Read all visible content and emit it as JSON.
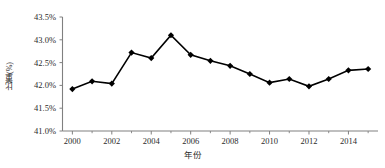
{
  "chart_data": {
    "type": "line",
    "title": "",
    "xlabel": "年份",
    "ylabel": "比重(%)",
    "x": [
      2000,
      2001,
      2002,
      2003,
      2004,
      2005,
      2006,
      2007,
      2008,
      2009,
      2010,
      2011,
      2012,
      2013,
      2014,
      2015
    ],
    "values": [
      41.92,
      42.09,
      42.04,
      42.72,
      42.6,
      43.1,
      42.67,
      42.54,
      42.43,
      42.25,
      42.06,
      42.14,
      41.98,
      42.14,
      42.33,
      42.36
    ],
    "series": [
      {
        "name": "比重(%)",
        "values": [
          41.92,
          42.09,
          42.04,
          42.72,
          42.6,
          43.1,
          42.67,
          42.54,
          42.43,
          42.25,
          42.06,
          42.14,
          41.98,
          42.14,
          42.33,
          42.36
        ]
      }
    ],
    "ylim": [
      41.0,
      43.5
    ],
    "xlim": [
      1999.5,
      2015.5
    ],
    "y_ticks": [
      41.0,
      41.5,
      42.0,
      42.5,
      43.0,
      43.5
    ],
    "y_tick_labels": [
      "41.0%",
      "41.5%",
      "42.0%",
      "42.5%",
      "43.0%",
      "43.5%"
    ],
    "x_ticks_major": [
      2000,
      2002,
      2004,
      2006,
      2008,
      2010,
      2012,
      2014
    ],
    "x_tick_labels": [
      "2000",
      "2002",
      "2004",
      "2006",
      "2008",
      "2010",
      "2012",
      "2014"
    ],
    "x_ticks_minor": [
      2001,
      2003,
      2005,
      2007,
      2009,
      2011,
      2013,
      2015
    ],
    "grid": false,
    "legend": "none",
    "marker": "diamond",
    "line_color": "#000000",
    "marker_color": "#000000",
    "axis_color": "#808080",
    "background": "#ffffff"
  },
  "axes": {
    "y_title": "比重(%)",
    "x_title": "年份"
  }
}
